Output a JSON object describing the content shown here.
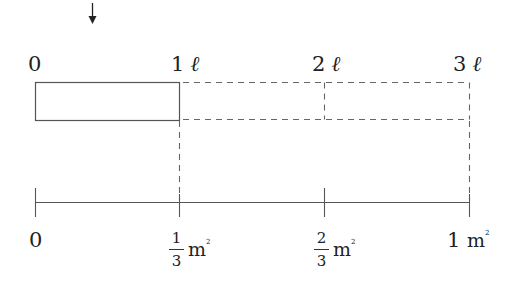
{
  "diagram": {
    "arrow_icon": "down-arrow-icon",
    "top_labels": [
      {
        "value": "0",
        "unit": ""
      },
      {
        "value": "1",
        "unit": "ℓ"
      },
      {
        "value": "2",
        "unit": "ℓ"
      },
      {
        "value": "3",
        "unit": "ℓ"
      }
    ],
    "bottom_labels": [
      {
        "value": "0",
        "unit": ""
      },
      {
        "numerator": "1",
        "denominator": "3",
        "unit": "m",
        "sup": "2"
      },
      {
        "numerator": "2",
        "denominator": "3",
        "unit": "m",
        "sup": "2"
      },
      {
        "value": "1",
        "unit": "m",
        "sup": "2"
      }
    ],
    "colors": {
      "line": "#444444",
      "text": "#222222",
      "background": "#ffffff"
    }
  }
}
